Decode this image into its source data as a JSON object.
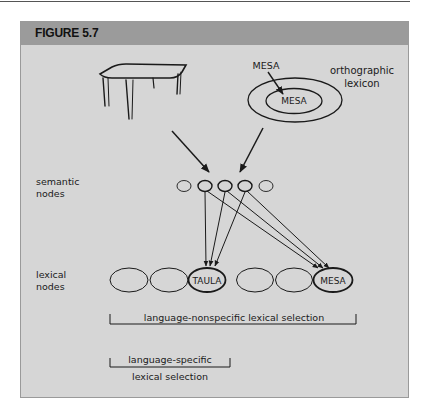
{
  "figure": {
    "title": "FIGURE 5.7"
  },
  "labels": {
    "semantic_nodes_line1": "semantic",
    "semantic_nodes_line2": "nodes",
    "lexical_nodes_line1": "lexical",
    "lexical_nodes_line2": "nodes",
    "orthographic_line1": "orthographic",
    "orthographic_line2": "lexicon",
    "mesa_input": "MESA",
    "mesa_lexicon": "MESA",
    "taula_node": "TAULA",
    "mesa_node": "MESA",
    "nonspecific_selection": "language-nonspecific lexical selection",
    "specific_line1": "language-specific",
    "specific_line2": "lexical selection"
  },
  "colors": {
    "header_bg": "#9b9b9b",
    "panel_bg": "#d6d6d6",
    "stroke": "#1a1a1a"
  }
}
